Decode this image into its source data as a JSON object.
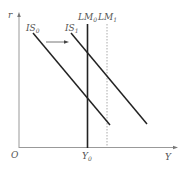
{
  "diagram": {
    "type": "IS-LM",
    "axes": {
      "y_label": "r",
      "x_label": "Y",
      "origin_label": "O"
    },
    "curves": [
      {
        "id": "IS0",
        "label": "IS",
        "subscript": "0",
        "style": "solid"
      },
      {
        "id": "IS1",
        "label": "IS",
        "subscript": "1",
        "style": "solid"
      },
      {
        "id": "LM0",
        "label": "LM",
        "subscript": "0",
        "style": "solid"
      },
      {
        "id": "LM1",
        "label": "LM",
        "subscript": "1",
        "style": "dotted"
      }
    ],
    "shift_arrow": {
      "from": "IS0",
      "to": "IS1",
      "direction": "right"
    },
    "x_tick": {
      "label": "Y",
      "subscript": "0"
    },
    "colors": {
      "axis": "#999999",
      "curve": "#222222",
      "dotted": "#aaaaaa",
      "text": "#555555"
    }
  }
}
